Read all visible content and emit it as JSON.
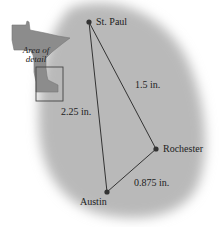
{
  "inset": {
    "label_line1": "Area of",
    "label_line2": "detail"
  },
  "cities": [
    {
      "name": "St. Paul",
      "x": 89,
      "y": 22
    },
    {
      "name": "Rochester",
      "x": 156,
      "y": 149
    },
    {
      "name": "Austin",
      "x": 107,
      "y": 192
    }
  ],
  "distances": [
    {
      "from": "St. Paul",
      "to": "Rochester",
      "label": "1.5 in."
    },
    {
      "from": "St. Paul",
      "to": "Austin",
      "label": "2.25 in."
    },
    {
      "from": "Rochester",
      "to": "Austin",
      "label": "0.875 in."
    }
  ],
  "colors": {
    "region": "#b9b9b9",
    "state": "#8c8c8c",
    "line": "#333333",
    "dot": "#333333"
  }
}
